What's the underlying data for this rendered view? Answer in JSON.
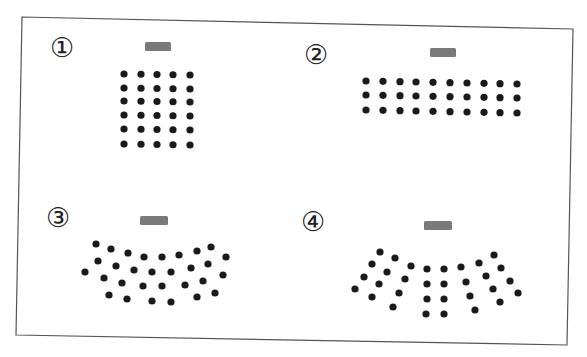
{
  "frame": {
    "corners": [
      [
        22,
        17
      ],
      [
        573,
        29
      ],
      [
        567,
        345
      ],
      [
        16,
        335
      ]
    ],
    "stroke": "#555555",
    "background": "#ffffff"
  },
  "colors": {
    "dot": "#1a1a1a",
    "desk": "#7a7a7a",
    "label": "#222222"
  },
  "dot_radius": 3.6,
  "panels": [
    {
      "id": "1",
      "label": "①",
      "label_pos": [
        62,
        48
      ],
      "desk": {
        "x": 145,
        "y": 42,
        "w": 26,
        "h": 9
      },
      "layout": "grid",
      "grid": {
        "cols": [
          124,
          141,
          157,
          173,
          190
        ],
        "rows": [
          74,
          88,
          101,
          115,
          129,
          144
        ],
        "tilt": 1
      }
    },
    {
      "id": "2",
      "label": "②",
      "label_pos": [
        316,
        55
      ],
      "desk": {
        "x": 430,
        "y": 48,
        "w": 26,
        "h": 9
      },
      "layout": "grid",
      "grid": {
        "cols": [
          366,
          383,
          400,
          416,
          433,
          450,
          467,
          484,
          500,
          517
        ],
        "rows": [
          81,
          95,
          110
        ],
        "tilt": 3
      }
    },
    {
      "id": "3",
      "label": "③",
      "label_pos": [
        58,
        218
      ],
      "desk": {
        "x": 140,
        "y": 216,
        "w": 28,
        "h": 9
      },
      "layout": "points",
      "points": [
        [
          96,
          244
        ],
        [
          111,
          249
        ],
        [
          128,
          253
        ],
        [
          144,
          257
        ],
        [
          162,
          257
        ],
        [
          179,
          255
        ],
        [
          197,
          251
        ],
        [
          211,
          247
        ],
        [
          226,
          257
        ],
        [
          85,
          272
        ],
        [
          98,
          261
        ],
        [
          116,
          266
        ],
        [
          134,
          270
        ],
        [
          152,
          272
        ],
        [
          171,
          272
        ],
        [
          191,
          268
        ],
        [
          208,
          264
        ],
        [
          223,
          275
        ],
        [
          104,
          278
        ],
        [
          122,
          283
        ],
        [
          143,
          286
        ],
        [
          162,
          286
        ],
        [
          185,
          285
        ],
        [
          203,
          281
        ],
        [
          109,
          295
        ],
        [
          127,
          299
        ],
        [
          152,
          301
        ],
        [
          171,
          302
        ],
        [
          197,
          297
        ],
        [
          215,
          293
        ]
      ]
    },
    {
      "id": "4",
      "label": "④",
      "label_pos": [
        313,
        222
      ],
      "desk": {
        "x": 424,
        "y": 221,
        "w": 28,
        "h": 9
      },
      "layout": "points",
      "points": [
        [
          380,
          252
        ],
        [
          395,
          258
        ],
        [
          411,
          266
        ],
        [
          372,
          264
        ],
        [
          387,
          272
        ],
        [
          405,
          279
        ],
        [
          364,
          277
        ],
        [
          379,
          284
        ],
        [
          399,
          293
        ],
        [
          355,
          289
        ],
        [
          372,
          297
        ],
        [
          393,
          307
        ],
        [
          427,
          269
        ],
        [
          444,
          269
        ],
        [
          427,
          284
        ],
        [
          444,
          284
        ],
        [
          427,
          299
        ],
        [
          444,
          299
        ],
        [
          426,
          314
        ],
        [
          444,
          314
        ],
        [
          461,
          267
        ],
        [
          479,
          263
        ],
        [
          494,
          255
        ],
        [
          466,
          282
        ],
        [
          486,
          276
        ],
        [
          501,
          268
        ],
        [
          470,
          296
        ],
        [
          493,
          289
        ],
        [
          510,
          281
        ],
        [
          475,
          310
        ],
        [
          500,
          302
        ],
        [
          518,
          293
        ]
      ]
    }
  ]
}
